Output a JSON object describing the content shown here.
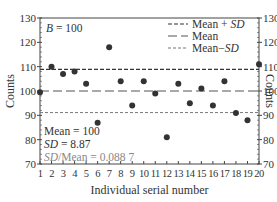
{
  "chart_data": {
    "type": "scatter",
    "title": "",
    "xlabel": "Individual serial number",
    "ylabel": "Counts",
    "y2label": "Counts",
    "xlim": [
      1,
      20
    ],
    "ylim": [
      70,
      130
    ],
    "x_ticks": [
      "1",
      "2",
      "3",
      "4",
      "5",
      "6",
      "7",
      "8",
      "9",
      "10",
      "11",
      "12",
      "13",
      "14",
      "15",
      "16",
      "17",
      "18",
      "19",
      "20"
    ],
    "y_ticks": [
      "70",
      "80",
      "90",
      "100",
      "110",
      "120",
      "130"
    ],
    "grid": false,
    "legend_position": "upper right",
    "x": [
      1,
      2,
      3,
      4,
      5,
      6,
      7,
      8,
      9,
      10,
      11,
      12,
      13,
      14,
      15,
      16,
      17,
      18,
      19,
      20
    ],
    "series": [
      {
        "name": "Counts",
        "values": [
          99.5,
          110,
          107,
          108,
          103,
          87,
          118,
          104,
          94,
          104,
          99,
          81,
          103,
          95,
          101,
          94,
          104,
          91,
          88,
          111
        ]
      }
    ],
    "reference_lines": [
      {
        "name": "Mean + SD",
        "value": 108.87,
        "style": "short-dash"
      },
      {
        "name": "Mean",
        "value": 100,
        "style": "long-dash"
      },
      {
        "name": "Mean−SD",
        "value": 91.13,
        "style": "short-dash-gray"
      }
    ],
    "annotations": {
      "top_left": "B = 100",
      "stats": [
        "Mean = 100",
        "SD = 8.87",
        "SD/Mean = 0.088 7"
      ]
    }
  },
  "legend": {
    "items": [
      {
        "label_prefix": "Mean + ",
        "label_italic": "SD"
      },
      {
        "label_prefix": "Mean",
        "label_italic": ""
      },
      {
        "label_prefix": "Mean−",
        "label_italic": "SD"
      }
    ]
  },
  "text": {
    "b_label_var": "B",
    "b_label_rest": " = 100",
    "mean_text": "Mean = 100",
    "sd_var": "SD",
    "sd_rest": " = 8.87",
    "ratio_var": "SD",
    "ratio_rest": "/Mean = 0.088 7",
    "xlabel": "Individual serial number",
    "ylabel": "Counts"
  },
  "colors": {
    "axis": "#444444",
    "points": "#333333",
    "gray_text": "#888888"
  }
}
